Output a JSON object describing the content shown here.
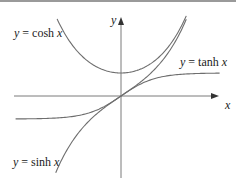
{
  "chart_data": {
    "type": "line",
    "title": "",
    "xlabel": "x",
    "ylabel": "y",
    "grid": false,
    "legend": "inline labels",
    "axis_ranges": {
      "x": [
        -3.1,
        2.9
      ],
      "y": [
        -3.6,
        3.4
      ]
    },
    "series": [
      {
        "name": "y = cosh x",
        "function": "cosh",
        "label_position": "upper-left",
        "points": [
          [
            -1.9,
            3.42
          ],
          [
            -1.5,
            2.35
          ],
          [
            -1.0,
            1.54
          ],
          [
            -0.5,
            1.13
          ],
          [
            0,
            1.0
          ],
          [
            0.5,
            1.13
          ],
          [
            1.0,
            1.54
          ],
          [
            1.5,
            2.35
          ],
          [
            1.9,
            3.42
          ]
        ]
      },
      {
        "name": "y = tanh x",
        "function": "tanh",
        "label_position": "upper-right",
        "points": [
          [
            -3.1,
            -1.0
          ],
          [
            -2.0,
            -0.96
          ],
          [
            -1.0,
            -0.76
          ],
          [
            -0.5,
            -0.46
          ],
          [
            0,
            0
          ],
          [
            0.5,
            0.46
          ],
          [
            1.0,
            0.76
          ],
          [
            2.0,
            0.96
          ],
          [
            2.9,
            0.99
          ]
        ]
      },
      {
        "name": "y = sinh x",
        "function": "sinh",
        "label_position": "lower-left",
        "points": [
          [
            -1.92,
            -3.34
          ],
          [
            -1.5,
            -2.13
          ],
          [
            -1.0,
            -1.18
          ],
          [
            -0.5,
            -0.52
          ],
          [
            0,
            0
          ],
          [
            0.5,
            0.52
          ],
          [
            1.0,
            1.18
          ],
          [
            1.5,
            2.13
          ],
          [
            1.92,
            3.34
          ]
        ]
      }
    ]
  },
  "labels": {
    "cosh": {
      "prefix": "y",
      "eq": " = cosh ",
      "var": "x"
    },
    "tanh": {
      "prefix": "y",
      "eq": " = tanh ",
      "var": "x"
    },
    "sinh": {
      "prefix": "y",
      "eq": " = sinh ",
      "var": "x"
    },
    "x_axis": "x",
    "y_axis": "y"
  },
  "colors": {
    "curve": "#6e6e6e",
    "axis": "#7a7a7a",
    "text": "#222222",
    "border": "#9a9a9a"
  }
}
